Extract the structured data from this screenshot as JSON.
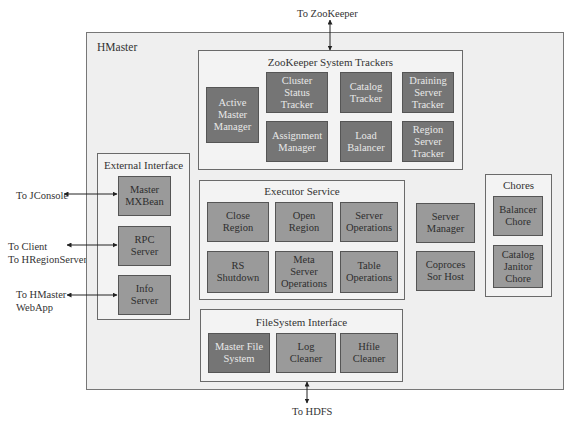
{
  "external_labels": {
    "zookeeper": "To ZooKeeper",
    "hdfs": "To HDFS",
    "jconsole": "To JConsole",
    "client": "To Client\nTo HRegionServers",
    "webapp": "To HMaster\nWebApp"
  },
  "hmaster": {
    "title": "HMaster",
    "zookeeper_trackers": {
      "title": "ZooKeeper System Trackers",
      "nodes": [
        {
          "label": "Active\nMaster\nManager"
        },
        {
          "label": "Cluster\nStatus\nTracker"
        },
        {
          "label": "Catalog\nTracker"
        },
        {
          "label": "Draining\nServer\nTracker"
        },
        {
          "label": "Assignment\nManager"
        },
        {
          "label": "Load\nBalancer"
        },
        {
          "label": "Region\nServer\nTracker"
        }
      ]
    },
    "external_interface": {
      "title": "External Interface",
      "nodes": [
        {
          "label": "Master\nMXBean"
        },
        {
          "label": "RPC\nServer"
        },
        {
          "label": "Info\nServer"
        }
      ]
    },
    "executor_service": {
      "title": "Executor Service",
      "nodes": [
        {
          "label": "Close\nRegion"
        },
        {
          "label": "Open\nRegion"
        },
        {
          "label": "Server\nOperations"
        },
        {
          "label": "RS\nShutdown"
        },
        {
          "label": "Meta\nServer\nOperations"
        },
        {
          "label": "Table\nOperations"
        }
      ]
    },
    "standalone": [
      {
        "label": "Server\nManager"
      },
      {
        "label": "Coproces\nSor Host"
      }
    ],
    "chores": {
      "title": "Chores",
      "nodes": [
        {
          "label": "Balancer\nChore"
        },
        {
          "label": "Catalog\nJanitor\nChore"
        }
      ]
    },
    "filesystem_interface": {
      "title": "FileSystem Interface",
      "nodes": [
        {
          "label": "Master File\nSystem"
        },
        {
          "label": "Log\nCleaner"
        },
        {
          "label": "Hfile\nCleaner"
        }
      ]
    }
  },
  "colors": {
    "dark_node": "#757575",
    "mid_node": "#9a9a9a",
    "group_bg": "#f3f3f3",
    "outer_bg": "#efefef"
  }
}
